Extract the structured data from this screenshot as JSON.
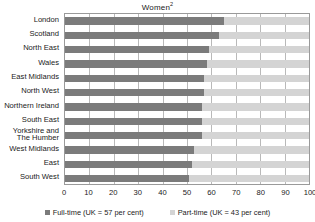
{
  "chart_data": {
    "type": "bar",
    "orientation": "horizontal",
    "stacked": true,
    "title": "Women",
    "title_superscript": "2",
    "xlabel": "",
    "ylabel": "",
    "xlim": [
      0,
      100
    ],
    "xticks": [
      0,
      10,
      20,
      30,
      40,
      50,
      60,
      70,
      80,
      90,
      100
    ],
    "grid": true,
    "legend_position": "bottom",
    "categories": [
      "London",
      "Scotland",
      "North East",
      "Wales",
      "East Midlands",
      "North West",
      "Northern Ireland",
      "South East",
      "Yorkshire and The Humber",
      "West Midlands",
      "East",
      "South West"
    ],
    "series": [
      {
        "name": "Full-time (UK = 57 per cent)",
        "short_name": "Full-time",
        "color": "#7b7b7b",
        "values": [
          65,
          63,
          59,
          58,
          57,
          57,
          56,
          56,
          56,
          53,
          52,
          51
        ]
      },
      {
        "name": "Part-time (UK = 43 per cent)",
        "short_name": "Part-time",
        "color": "#d4d4d4",
        "values": [
          35,
          37,
          41,
          42,
          43,
          43,
          44,
          44,
          44,
          47,
          48,
          49
        ]
      }
    ]
  },
  "legend": {
    "items": [
      {
        "label": "Full-time (UK = 57 per cent)",
        "swatch": "full"
      },
      {
        "label": "Part-time (UK = 43 per cent)",
        "swatch": "part"
      }
    ]
  }
}
